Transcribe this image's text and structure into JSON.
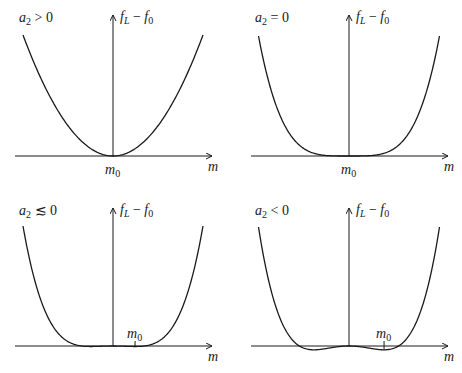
{
  "chart_data": [
    {
      "type": "line",
      "panel": "top-left",
      "title": "a2 > 0",
      "title_parts": {
        "var": "a",
        "sub": "2",
        "rel": " > 0"
      },
      "xlabel": "m",
      "ylabel": "f_L − f_0",
      "ylabel_parts": {
        "f1": "f",
        "s1": "L",
        "minus": " − ",
        "f2": "f",
        "s2": "0"
      },
      "tick_label": {
        "var": "m",
        "sub": "0"
      },
      "curve": "parabola: single minimum at m0 on the y-axis",
      "shape_params": {
        "a2": 1.0,
        "a4": 0.0
      },
      "minimum_x": 0
    },
    {
      "type": "line",
      "panel": "top-right",
      "title": "a2 = 0",
      "title_parts": {
        "var": "a",
        "sub": "2",
        "rel": " = 0"
      },
      "xlabel": "m",
      "ylabel": "f_L − f_0",
      "ylabel_parts": {
        "f1": "f",
        "s1": "L",
        "minus": " − ",
        "f2": "f",
        "s2": "0"
      },
      "tick_label": {
        "var": "m",
        "sub": "0"
      },
      "curve": "quartic: flat minimum at m0 on the y-axis",
      "shape_params": {
        "a2": 0.0,
        "a4": 1.0
      },
      "minimum_x": 0
    },
    {
      "type": "line",
      "panel": "bottom-left",
      "title": "a2 ≲ 0",
      "title_parts": {
        "var": "a",
        "sub": "2",
        "rel": " ≲ 0"
      },
      "xlabel": "m",
      "ylabel": "f_L − f_0",
      "ylabel_parts": {
        "f1": "f",
        "s1": "L",
        "minus": " − ",
        "f2": "f",
        "s2": "0"
      },
      "tick_label": {
        "var": "m",
        "sub": "0"
      },
      "curve": "double-well with shallow minima; m0 marked at right minimum",
      "shape_params": {
        "a2": -0.12,
        "a4": 1.0
      },
      "minimum_x": 0.25
    },
    {
      "type": "line",
      "panel": "bottom-right",
      "title": "a2 < 0",
      "title_parts": {
        "var": "a",
        "sub": "2",
        "rel": " < 0"
      },
      "xlabel": "m",
      "ylabel": "f_L − f_0",
      "ylabel_parts": {
        "f1": "f",
        "s1": "L",
        "minus": " − ",
        "f2": "f",
        "s2": "0"
      },
      "tick_label": {
        "var": "m",
        "sub": "0"
      },
      "curve": "double-well with deeper minima; m0 marked at right minimum",
      "shape_params": {
        "a2": -0.3,
        "a4": 1.0
      },
      "minimum_x": 0.45
    }
  ],
  "style": {
    "line_color": "#1a1a1a",
    "background": "#ffffff"
  }
}
